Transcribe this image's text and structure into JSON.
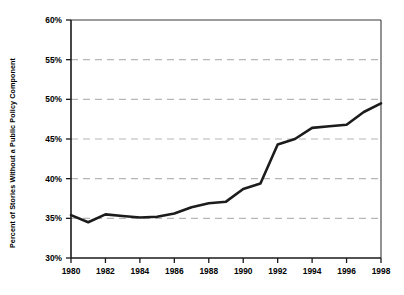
{
  "chart_data": {
    "type": "line",
    "title": "",
    "subtitle": "",
    "xlabel": "",
    "ylabel": "Percent of Stories Without a Public Policy Component",
    "xlim": [
      1980,
      1998
    ],
    "ylim": [
      30,
      60
    ],
    "grid": "horizontal-dashed",
    "legend": "none",
    "y_tick_labels": [
      "60%",
      "55%",
      "50%",
      "45%",
      "40%",
      "35%",
      "30%"
    ],
    "y_ticks": [
      60,
      55,
      50,
      45,
      40,
      35,
      30
    ],
    "x_tick_labels": [
      "1980",
      "1982",
      "1984",
      "1986",
      "1988",
      "1990",
      "1992",
      "1994",
      "1996",
      "1998"
    ],
    "x_ticks": [
      1980,
      1982,
      1984,
      1986,
      1988,
      1990,
      1992,
      1994,
      1996,
      1998
    ],
    "x": [
      1980,
      1981,
      1982,
      1983,
      1984,
      1985,
      1986,
      1987,
      1988,
      1989,
      1990,
      1991,
      1992,
      1993,
      1994,
      1995,
      1996,
      1997,
      1998
    ],
    "series": [
      {
        "name": "Percent of Stories Without a Public Policy Component",
        "color": "#1c1c1c",
        "values": [
          35.4,
          34.5,
          35.5,
          35.3,
          35.1,
          35.2,
          35.6,
          36.4,
          36.9,
          37.1,
          38.7,
          39.4,
          44.3,
          45.0,
          46.4,
          46.6,
          46.8,
          48.4,
          49.5
        ]
      }
    ]
  },
  "axis": {
    "y_title": "Percent of Stories Without a Public Policy Component"
  }
}
